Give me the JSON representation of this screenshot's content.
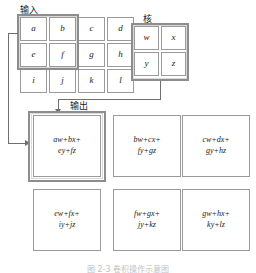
{
  "figure": {
    "caption": "图 2-3  卷积操作示意图",
    "labels": {
      "input": "输入",
      "kernel": "核",
      "output": "输出"
    }
  },
  "input_grid": {
    "rows": 3,
    "cols": 4,
    "cells": [
      [
        "a",
        "b",
        "c",
        "d"
      ],
      [
        "e",
        "f",
        "g",
        "h"
      ],
      [
        "i",
        "j",
        "k",
        "l"
      ]
    ],
    "highlight": {
      "rows": [
        0,
        1
      ],
      "cols": [
        0,
        1
      ],
      "color": "#8d8d8d"
    }
  },
  "kernel_grid": {
    "rows": 2,
    "cols": 2,
    "cells": [
      [
        "w",
        "x"
      ],
      [
        "y",
        "z"
      ]
    ],
    "highlight_color": "#8d8d8d"
  },
  "output_grid": {
    "rows": 2,
    "cols": 3,
    "cells": [
      [
        {
          "line1": "aw+bx+",
          "line2": "ey+fz"
        },
        {
          "line1": "bw+cx+",
          "line2": "fy+gz"
        },
        {
          "line1": "cw+dx+",
          "line2": "gy+hz"
        }
      ],
      [
        {
          "line1": "ew+fx+",
          "line2": "iy+jz"
        },
        {
          "line1": "fw+gx+",
          "line2": "jy+kz"
        },
        {
          "line1": "gw+hx+",
          "line2": "ky+lz"
        }
      ]
    ],
    "highlight": {
      "row": 0,
      "col": 0,
      "color": "#8d8d8d"
    }
  },
  "connectors": {
    "input_to_output": "arrow-from-input-highlight-to-output-cell-0-0",
    "kernel_to_output": "arrow-from-kernel-to-output-cell-0-0",
    "line_color": "#6f6f6f"
  }
}
